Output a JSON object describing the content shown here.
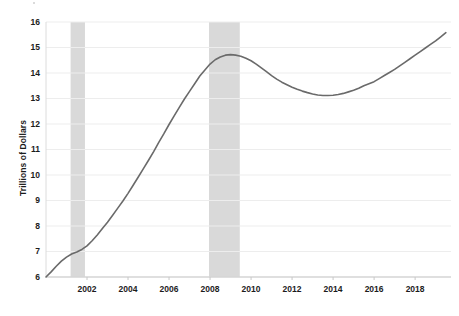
{
  "chart_data": {
    "type": "line",
    "title": "",
    "subtitle": "",
    "xlabel": "",
    "ylabel": "Trillions of Dollars",
    "xlim": [
      2000.0,
      2019.75
    ],
    "ylim": [
      6,
      16
    ],
    "grid": true,
    "legend": null,
    "line_color": "#6a6a6a",
    "recession_band_color": "#d9d9d9",
    "background_color": "#ffffff",
    "axis_color": "#c8c8c8",
    "ytick_labels": [
      "6",
      "7",
      "8",
      "9",
      "10",
      "11",
      "12",
      "13",
      "14",
      "15",
      "16"
    ],
    "yticks": [
      6,
      7,
      8,
      9,
      10,
      11,
      12,
      13,
      14,
      15,
      16
    ],
    "xtick_labels": [
      "2002",
      "2004",
      "2006",
      "2008",
      "2010",
      "2012",
      "2014",
      "2016",
      "2018"
    ],
    "xticks": [
      2002,
      2004,
      2006,
      2008,
      2010,
      2012,
      2014,
      2016,
      2018
    ],
    "recession_bands": [
      {
        "start": 2001.2,
        "end": 2001.9,
        "label": "2001 recession"
      },
      {
        "start": 2007.95,
        "end": 2009.45,
        "label": "2008-2009 recession"
      }
    ],
    "series": [
      {
        "name": "Total Debt",
        "x": [
          2000.0,
          2000.25,
          2000.5,
          2000.75,
          2001.0,
          2001.25,
          2001.5,
          2001.75,
          2002.0,
          2002.25,
          2002.5,
          2002.75,
          2003.0,
          2003.25,
          2003.5,
          2003.75,
          2004.0,
          2004.25,
          2004.5,
          2004.75,
          2005.0,
          2005.25,
          2005.5,
          2005.75,
          2006.0,
          2006.25,
          2006.5,
          2006.75,
          2007.0,
          2007.25,
          2007.5,
          2007.75,
          2008.0,
          2008.25,
          2008.5,
          2008.75,
          2009.0,
          2009.25,
          2009.5,
          2009.75,
          2010.0,
          2010.25,
          2010.5,
          2010.75,
          2011.0,
          2011.25,
          2011.5,
          2011.75,
          2012.0,
          2012.25,
          2012.5,
          2012.75,
          2013.0,
          2013.25,
          2013.5,
          2013.75,
          2014.0,
          2014.25,
          2014.5,
          2014.75,
          2015.0,
          2015.25,
          2015.5,
          2015.75,
          2016.0,
          2016.25,
          2016.5,
          2016.75,
          2017.0,
          2017.25,
          2017.5,
          2017.75,
          2018.0,
          2018.25,
          2018.5,
          2018.75,
          2019.0,
          2019.25,
          2019.5
        ],
        "y": [
          6.0,
          6.2,
          6.42,
          6.62,
          6.78,
          6.9,
          6.98,
          7.08,
          7.22,
          7.42,
          7.65,
          7.9,
          8.15,
          8.42,
          8.7,
          8.98,
          9.28,
          9.6,
          9.92,
          10.25,
          10.58,
          10.92,
          11.28,
          11.62,
          11.98,
          12.32,
          12.65,
          12.98,
          13.28,
          13.58,
          13.88,
          14.12,
          14.35,
          14.52,
          14.63,
          14.7,
          14.72,
          14.7,
          14.66,
          14.58,
          14.48,
          14.35,
          14.2,
          14.05,
          13.9,
          13.76,
          13.64,
          13.54,
          13.44,
          13.36,
          13.29,
          13.23,
          13.18,
          13.14,
          13.12,
          13.12,
          13.13,
          13.16,
          13.2,
          13.26,
          13.32,
          13.4,
          13.5,
          13.58,
          13.66,
          13.78,
          13.9,
          14.02,
          14.14,
          14.28,
          14.42,
          14.56,
          14.7,
          14.84,
          14.98,
          15.12,
          15.26,
          15.42,
          15.58
        ]
      }
    ]
  }
}
